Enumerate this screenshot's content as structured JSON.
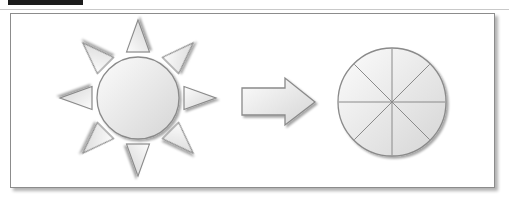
{
  "page": {
    "background": "#ffffff"
  },
  "top": {
    "black_bar_color": "#1c1c1c",
    "rule_color": "#c9c9c9"
  },
  "panel": {
    "background": "#ffffff",
    "border_color": "#8c8c8c",
    "shadow_color": "rgba(0,0,0,0.30)"
  },
  "diagram": {
    "shape_fill_light": "#fcfcfc",
    "shape_fill_dark": "#d5d5d5",
    "shape_stroke": "#8a8a8a",
    "drop_shadow_opacity": 0.35,
    "sun": {
      "icon": "sun-icon",
      "ray_count": 8,
      "ray_shape": "triangle"
    },
    "arrow": {
      "icon": "right-arrow-icon",
      "direction": "right"
    },
    "pie": {
      "icon": "segmented-circle-icon",
      "sector_count": 8
    }
  }
}
